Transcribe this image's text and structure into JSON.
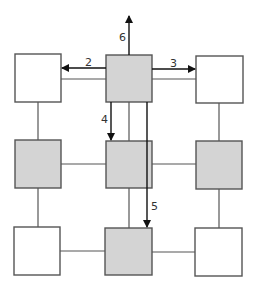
{
  "diagram": {
    "type": "grid-network",
    "colors": {
      "shaded_fill": "#d4d4d4",
      "plain_fill": "#ffffff",
      "stroke": "#555555",
      "arrow": "#111111"
    },
    "nodes": [
      {
        "id": "r0c0",
        "row": 0,
        "col": 0,
        "shaded": false
      },
      {
        "id": "r0c1",
        "row": 0,
        "col": 1,
        "shaded": true
      },
      {
        "id": "r0c2",
        "row": 0,
        "col": 2,
        "shaded": false
      },
      {
        "id": "r1c0",
        "row": 1,
        "col": 0,
        "shaded": true
      },
      {
        "id": "r1c1",
        "row": 1,
        "col": 1,
        "shaded": true
      },
      {
        "id": "r1c2",
        "row": 1,
        "col": 2,
        "shaded": true
      },
      {
        "id": "r2c0",
        "row": 2,
        "col": 0,
        "shaded": false
      },
      {
        "id": "r2c1",
        "row": 2,
        "col": 1,
        "shaded": true
      },
      {
        "id": "r2c2",
        "row": 2,
        "col": 2,
        "shaded": false
      }
    ],
    "arrows": [
      {
        "label": "2",
        "from": "r0c1",
        "to": "r0c0",
        "direction": "left"
      },
      {
        "label": "3",
        "from": "r0c1",
        "to": "r0c2",
        "direction": "right"
      },
      {
        "label": "4",
        "from": "r0c1",
        "to": "r1c1",
        "direction": "down"
      },
      {
        "label": "5",
        "from": "r0c1",
        "to": "r2c1",
        "direction": "down"
      },
      {
        "label": "6",
        "from": "r0c1",
        "to": "outside",
        "direction": "up"
      }
    ],
    "labels": {
      "arrow2": "2",
      "arrow3": "3",
      "arrow4": "4",
      "arrow5": "5",
      "arrow6": "6"
    }
  }
}
